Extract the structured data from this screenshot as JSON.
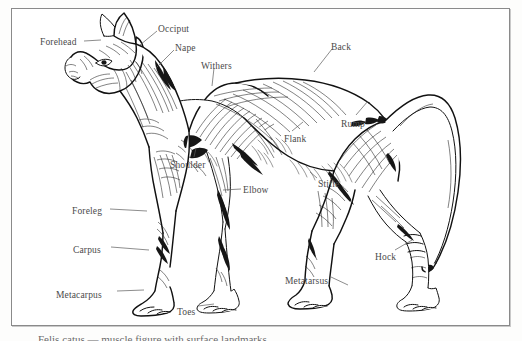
{
  "figure": {
    "caption": "Felis   catus  — muscle  figure  with  surface  landmarks",
    "frame_color": "#8a8a8a",
    "ink_color": "#111111",
    "label_color": "#4a4a4a",
    "background": "#ffffff"
  },
  "labels": [
    {
      "id": "forehead",
      "text": "Forehead",
      "x": 40,
      "y": 38,
      "leader": "M 84 41 L 101 40"
    },
    {
      "id": "occiput",
      "text": "Occiput",
      "x": 158,
      "y": 25,
      "leader": "M 157 31 L 140 45"
    },
    {
      "id": "nape",
      "text": "Nape",
      "x": 175,
      "y": 44,
      "leader": "M 174 50 L 156 68"
    },
    {
      "id": "withers",
      "text": "Withers",
      "x": 201,
      "y": 62,
      "leader": "M 214 68 L 212 86"
    },
    {
      "id": "back",
      "text": "Back",
      "x": 331,
      "y": 43,
      "leader": "M 332 49 L 314 72"
    },
    {
      "id": "rump",
      "text": "Rump",
      "x": 341,
      "y": 120,
      "leader": "M 356 115 L 368 101"
    },
    {
      "id": "flank",
      "text": "Flank",
      "x": 284,
      "y": 135,
      "leader": "M 292 131 L 303 122"
    },
    {
      "id": "shoulder",
      "text": "Shoulder",
      "x": 170,
      "y": 161,
      "leader": "M 194 157 L 196 148"
    },
    {
      "id": "elbow",
      "text": "Elbow",
      "x": 243,
      "y": 186,
      "leader": "M 241 189 L 223 190"
    },
    {
      "id": "stifle",
      "text": "Stifle",
      "x": 318,
      "y": 180,
      "leader": "M 317 178 L 310 172"
    },
    {
      "id": "foreleg",
      "text": "Foreleg",
      "x": 72,
      "y": 207,
      "leader": "M 110 209 L 147 211"
    },
    {
      "id": "carpus",
      "text": "Carpus",
      "x": 73,
      "y": 246,
      "leader": "M 111 247 L 149 250"
    },
    {
      "id": "metacarpus",
      "text": "Metacarpus",
      "x": 56,
      "y": 291,
      "leader": "M 117 291 L 144 290"
    },
    {
      "id": "toes",
      "text": "Toes",
      "x": 177,
      "y": 308,
      "leader": "M 198 306 L 214 304"
    },
    {
      "id": "hock",
      "text": "Hock",
      "x": 375,
      "y": 253,
      "leader": "M 395 250 L 412 240"
    },
    {
      "id": "metatarsus",
      "text": "Metatarsus",
      "x": 285,
      "y": 277,
      "leader": "M 331 277 L 348 285"
    }
  ]
}
